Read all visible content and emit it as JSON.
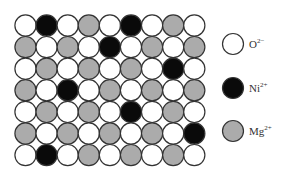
{
  "diagram": {
    "grid": {
      "rows": 7,
      "cols": 9,
      "cells": [
        [
          "O",
          "Ni",
          "O",
          "Mg",
          "O",
          "Ni",
          "O",
          "Mg",
          "O"
        ],
        [
          "Mg",
          "O",
          "Mg",
          "O",
          "Ni",
          "O",
          "Mg",
          "O",
          "Mg"
        ],
        [
          "O",
          "Mg",
          "O",
          "Mg",
          "O",
          "Mg",
          "O",
          "Ni",
          "O"
        ],
        [
          "Mg",
          "O",
          "Ni",
          "O",
          "Mg",
          "O",
          "Mg",
          "O",
          "Mg"
        ],
        [
          "O",
          "Mg",
          "O",
          "Mg",
          "O",
          "Ni",
          "O",
          "Mg",
          "O"
        ],
        [
          "Mg",
          "O",
          "Mg",
          "O",
          "Mg",
          "O",
          "Mg",
          "O",
          "Ni"
        ],
        [
          "O",
          "Ni",
          "O",
          "Mg",
          "O",
          "Mg",
          "O",
          "Mg",
          "O"
        ]
      ]
    },
    "colors": {
      "O": "#ffffff",
      "Ni": "#0a0a0a",
      "Mg": "#ababab",
      "stroke": "#333333"
    },
    "legend": [
      {
        "key": "O",
        "base": "O",
        "charge": "2−"
      },
      {
        "key": "Ni",
        "base": "Ni",
        "charge": "2+"
      },
      {
        "key": "Mg",
        "base": "Mg",
        "charge": "2+"
      }
    ]
  }
}
